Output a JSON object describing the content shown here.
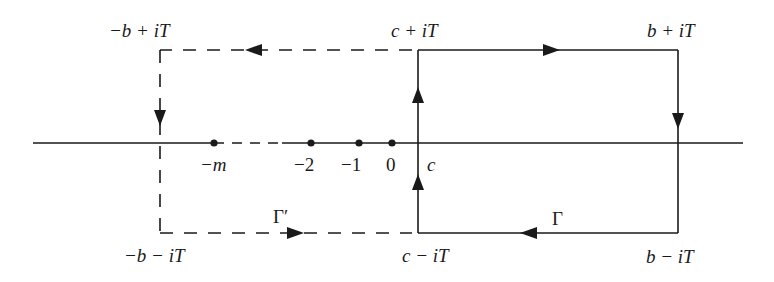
{
  "diagram": {
    "type": "contour-integral-diagram",
    "colors": {
      "line": "#1a1a1a",
      "background": "#ffffff"
    },
    "corner_labels": {
      "top_left": "−b + iT",
      "top_middle": "c + iT",
      "top_right": "b + iT",
      "bottom_left": "−b − iT",
      "bottom_middle": "c − iT",
      "bottom_right": "b − iT"
    },
    "axis_points": [
      {
        "label": "−m",
        "x": 214
      },
      {
        "label": "−2",
        "x": 311
      },
      {
        "label": "−1",
        "x": 359
      },
      {
        "label": "0",
        "x": 392
      }
    ],
    "c_label": "c",
    "contours": [
      {
        "name": "Γ",
        "style": "solid",
        "label": "Γ"
      },
      {
        "name": "Γ′",
        "style": "dashed",
        "label": "Γ′"
      }
    ]
  }
}
